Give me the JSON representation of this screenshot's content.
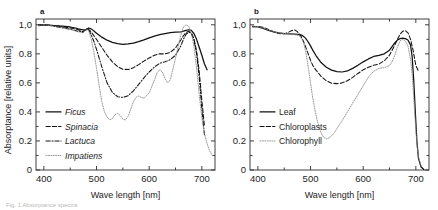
{
  "figure": {
    "panel_a_label": "a",
    "panel_b_label": "b",
    "ylabel": "Absorptance [relative units]",
    "xlabel_a": "Wave length [nm]",
    "xlabel_b": "Wave length [nm]",
    "caption": "Fig. 1 Absorptance spectra"
  },
  "axis": {
    "y_ticks": [
      "1,0",
      "0.8",
      "0.6",
      "0.4",
      "0.2",
      "0"
    ],
    "y_values": [
      1.0,
      0.8,
      0.6,
      0.4,
      0.2,
      0.0
    ],
    "x_ticks": [
      "400",
      "500",
      "600",
      "700"
    ],
    "x_values": [
      400,
      500,
      600,
      700
    ],
    "x_minor": [
      450,
      550,
      650
    ],
    "y_minor": [
      0.9,
      0.7,
      0.5,
      0.3,
      0.1
    ],
    "xlim": [
      385,
      725
    ],
    "ylim": [
      0,
      1.04
    ]
  },
  "legend_a": [
    {
      "label": "Ficus",
      "style": "solid",
      "italic": true
    },
    {
      "label": "Spinacia",
      "style": "dashed",
      "italic": true
    },
    {
      "label": "Lactuca",
      "style": "dashdot",
      "italic": true
    },
    {
      "label": "Impatiens",
      "style": "dotted",
      "italic": true
    }
  ],
  "legend_b": [
    {
      "label": "Leaf",
      "style": "solid",
      "italic": false
    },
    {
      "label": "Chloroplasts",
      "style": "dashed",
      "italic": false
    },
    {
      "label": "Chlorophyll",
      "style": "dotted",
      "italic": false
    }
  ],
  "chart_data": [
    {
      "type": "line",
      "panel": "a",
      "title": "",
      "xlabel": "Wave length [nm]",
      "ylabel": "Absorptance [relative units]",
      "xlim": [
        385,
        725
      ],
      "ylim": [
        0,
        1.04
      ],
      "grid": false,
      "legend_position": "lower-left",
      "series": [
        {
          "name": "Ficus",
          "style": "solid",
          "color": "#111111",
          "x": [
            390,
            400,
            410,
            420,
            430,
            440,
            450,
            460,
            465,
            470,
            475,
            478,
            482,
            485,
            490,
            495,
            500,
            510,
            520,
            530,
            540,
            550,
            560,
            570,
            580,
            590,
            600,
            610,
            620,
            630,
            640,
            650,
            660,
            665,
            670,
            675,
            680,
            685,
            690,
            695,
            700,
            705,
            710
          ],
          "y": [
            0.995,
            1.0,
            0.998,
            0.995,
            0.992,
            0.99,
            0.985,
            0.978,
            0.972,
            0.968,
            0.965,
            0.962,
            0.97,
            0.978,
            0.972,
            0.958,
            0.942,
            0.915,
            0.894,
            0.879,
            0.87,
            0.866,
            0.868,
            0.874,
            0.884,
            0.896,
            0.91,
            0.922,
            0.932,
            0.94,
            0.946,
            0.949,
            0.952,
            0.956,
            0.962,
            0.966,
            0.962,
            0.94,
            0.9,
            0.845,
            0.79,
            0.73,
            0.69
          ]
        },
        {
          "name": "Spinacia",
          "style": "dashed",
          "color": "#111111",
          "x": [
            390,
            400,
            410,
            420,
            430,
            440,
            450,
            460,
            465,
            470,
            474,
            478,
            482,
            486,
            490,
            495,
            500,
            505,
            510,
            520,
            530,
            540,
            550,
            560,
            570,
            580,
            590,
            600,
            610,
            620,
            630,
            640,
            650,
            660,
            665,
            670,
            675,
            680,
            685,
            690,
            695,
            700,
            705
          ],
          "y": [
            0.998,
            1.0,
            0.997,
            0.993,
            0.988,
            0.984,
            0.979,
            0.972,
            0.966,
            0.959,
            0.953,
            0.962,
            0.972,
            0.965,
            0.95,
            0.925,
            0.9,
            0.872,
            0.845,
            0.79,
            0.745,
            0.712,
            0.694,
            0.692,
            0.705,
            0.726,
            0.75,
            0.772,
            0.79,
            0.8,
            0.8,
            0.81,
            0.84,
            0.895,
            0.925,
            0.948,
            0.955,
            0.945,
            0.905,
            0.82,
            0.68,
            0.48,
            0.3
          ]
        },
        {
          "name": "Lactuca",
          "style": "dashdot",
          "color": "#111111",
          "x": [
            390,
            400,
            410,
            420,
            430,
            440,
            450,
            458,
            464,
            470,
            474,
            478,
            482,
            486,
            490,
            495,
            500,
            505,
            510,
            520,
            530,
            540,
            550,
            560,
            570,
            580,
            590,
            600,
            610,
            620,
            630,
            640,
            650,
            660,
            665,
            670,
            675,
            680,
            685,
            690,
            695,
            700,
            705
          ],
          "y": [
            0.998,
            1.0,
            0.996,
            0.99,
            0.983,
            0.977,
            0.97,
            0.963,
            0.955,
            0.953,
            0.948,
            0.965,
            0.975,
            0.96,
            0.93,
            0.885,
            0.83,
            0.77,
            0.71,
            0.6,
            0.535,
            0.505,
            0.5,
            0.512,
            0.545,
            0.59,
            0.635,
            0.675,
            0.71,
            0.735,
            0.745,
            0.76,
            0.79,
            0.855,
            0.9,
            0.935,
            0.95,
            0.94,
            0.895,
            0.8,
            0.64,
            0.42,
            0.24
          ]
        },
        {
          "name": "Impatiens",
          "style": "dotted",
          "color": "#8a8a8a",
          "x": [
            390,
            400,
            410,
            420,
            430,
            440,
            450,
            458,
            464,
            470,
            474,
            478,
            482,
            486,
            490,
            495,
            500,
            505,
            510,
            515,
            520,
            525,
            530,
            535,
            540,
            545,
            550,
            555,
            560,
            565,
            570,
            575,
            580,
            585,
            590,
            600,
            610,
            615,
            620,
            625,
            630,
            635,
            640,
            650,
            655,
            660,
            665,
            670,
            675,
            680,
            685,
            690,
            695,
            700,
            705,
            710,
            715,
            720
          ],
          "y": [
            0.995,
            1.0,
            0.996,
            0.99,
            0.982,
            0.975,
            0.968,
            0.96,
            0.952,
            0.95,
            0.945,
            0.962,
            0.972,
            0.95,
            0.9,
            0.81,
            0.7,
            0.58,
            0.47,
            0.4,
            0.365,
            0.345,
            0.355,
            0.38,
            0.39,
            0.375,
            0.35,
            0.345,
            0.37,
            0.42,
            0.47,
            0.5,
            0.51,
            0.5,
            0.495,
            0.53,
            0.62,
            0.67,
            0.69,
            0.675,
            0.63,
            0.6,
            0.62,
            0.77,
            0.85,
            0.93,
            0.985,
            1.0,
            0.99,
            0.95,
            0.85,
            0.7,
            0.52,
            0.36,
            0.25,
            0.18,
            0.13,
            0.1
          ]
        }
      ]
    },
    {
      "type": "line",
      "panel": "b",
      "title": "",
      "xlabel": "Wave length [nm]",
      "ylabel": "Absorptance [relative units]",
      "xlim": [
        385,
        725
      ],
      "ylim": [
        0,
        1.04
      ],
      "grid": false,
      "legend_position": "lower-left",
      "series": [
        {
          "name": "Leaf",
          "style": "solid",
          "color": "#111111",
          "x": [
            390,
            400,
            410,
            420,
            430,
            440,
            450,
            460,
            470,
            475,
            480,
            485,
            490,
            495,
            500,
            505,
            510,
            520,
            530,
            540,
            550,
            560,
            570,
            580,
            590,
            600,
            610,
            620,
            630,
            640,
            650,
            660,
            665,
            670,
            675,
            680,
            685,
            690,
            693,
            696,
            699,
            702,
            705,
            710,
            715
          ],
          "y": [
            0.99,
            0.985,
            0.975,
            0.962,
            0.952,
            0.945,
            0.94,
            0.938,
            0.936,
            0.935,
            0.932,
            0.925,
            0.91,
            0.885,
            0.855,
            0.82,
            0.79,
            0.74,
            0.708,
            0.688,
            0.678,
            0.675,
            0.682,
            0.7,
            0.722,
            0.745,
            0.765,
            0.782,
            0.79,
            0.8,
            0.825,
            0.875,
            0.895,
            0.905,
            0.908,
            0.905,
            0.895,
            0.86,
            0.78,
            0.62,
            0.4,
            0.2,
            0.08,
            0.02,
            0.005
          ]
        },
        {
          "name": "Chloroplasts",
          "style": "dashed",
          "color": "#111111",
          "x": [
            390,
            400,
            410,
            420,
            430,
            440,
            450,
            458,
            464,
            470,
            474,
            478,
            482,
            486,
            490,
            495,
            500,
            505,
            510,
            520,
            530,
            540,
            550,
            560,
            570,
            580,
            590,
            600,
            610,
            620,
            630,
            640,
            650,
            660,
            665,
            670,
            675,
            680,
            685,
            690,
            695,
            700,
            705
          ],
          "y": [
            0.985,
            0.99,
            0.982,
            0.968,
            0.952,
            0.94,
            0.938,
            0.948,
            0.96,
            0.965,
            0.955,
            0.94,
            0.92,
            0.89,
            0.855,
            0.805,
            0.755,
            0.715,
            0.69,
            0.645,
            0.615,
            0.598,
            0.595,
            0.6,
            0.615,
            0.638,
            0.665,
            0.69,
            0.708,
            0.722,
            0.73,
            0.752,
            0.79,
            0.86,
            0.9,
            0.935,
            0.955,
            0.96,
            0.945,
            0.9,
            0.82,
            0.72,
            0.68
          ]
        },
        {
          "name": "Chlorophyll",
          "style": "dotted",
          "color": "#8a8a8a",
          "x": [
            390,
            400,
            410,
            420,
            430,
            440,
            450,
            460,
            470,
            478,
            484,
            488,
            492,
            496,
            500,
            504,
            508,
            512,
            516,
            520,
            525,
            530,
            535,
            540,
            545,
            550,
            560,
            570,
            580,
            590,
            600,
            610,
            620,
            630,
            640,
            650,
            655,
            660,
            665,
            670,
            675,
            680,
            685,
            690,
            693,
            696,
            699,
            702,
            705,
            710
          ],
          "y": [
            0.99,
            0.988,
            0.978,
            0.965,
            0.952,
            0.944,
            0.94,
            0.938,
            0.932,
            0.925,
            0.9,
            0.86,
            0.79,
            0.7,
            0.6,
            0.5,
            0.42,
            0.35,
            0.3,
            0.255,
            0.225,
            0.215,
            0.22,
            0.235,
            0.255,
            0.285,
            0.34,
            0.4,
            0.46,
            0.52,
            0.58,
            0.64,
            0.68,
            0.7,
            0.705,
            0.72,
            0.745,
            0.79,
            0.845,
            0.89,
            0.9,
            0.89,
            0.855,
            0.76,
            0.66,
            0.5,
            0.33,
            0.18,
            0.09,
            0.03
          ]
        }
      ]
    }
  ]
}
